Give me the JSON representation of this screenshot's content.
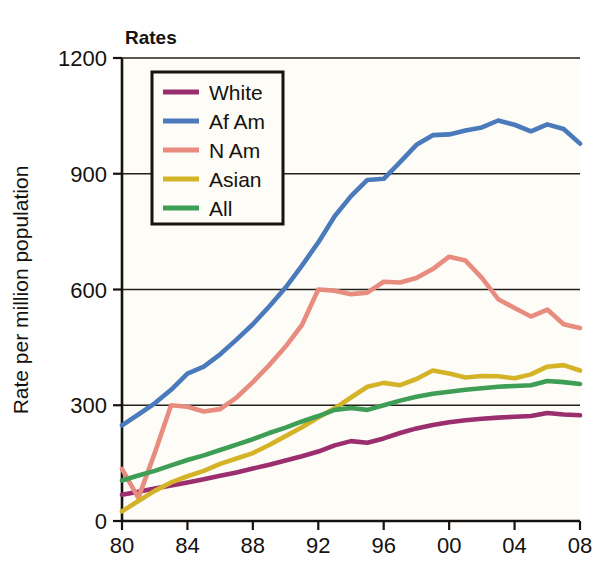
{
  "chart_data": {
    "type": "line",
    "title": "Rates",
    "xlabel": "",
    "ylabel": "Rate per million population",
    "xlim": [
      1980,
      2008
    ],
    "ylim": [
      0,
      1200
    ],
    "yticks": [
      0,
      300,
      600,
      900,
      1200
    ],
    "ytick_labels": [
      "0",
      "300",
      "600",
      "900",
      "1200"
    ],
    "xticks": [
      1980,
      1984,
      1988,
      1992,
      1996,
      2000,
      2004,
      2008
    ],
    "xtick_labels": [
      "80",
      "84",
      "88",
      "92",
      "96",
      "00",
      "04",
      "08"
    ],
    "grid": "horizontal",
    "legend_position": "top-left-inside",
    "x": [
      1980,
      1981,
      1982,
      1983,
      1984,
      1985,
      1986,
      1987,
      1988,
      1989,
      1990,
      1991,
      1992,
      1993,
      1994,
      1995,
      1996,
      1997,
      1998,
      1999,
      2000,
      2001,
      2002,
      2003,
      2004,
      2005,
      2006,
      2007,
      2008
    ],
    "series": [
      {
        "name": "White",
        "color": "#9B2E6E",
        "values": [
          68,
          76,
          84,
          92,
          100,
          108,
          117,
          126,
          136,
          146,
          157,
          168,
          180,
          196,
          207,
          203,
          214,
          228,
          240,
          249,
          256,
          261,
          265,
          268,
          270,
          272,
          280,
          276,
          274
        ]
      },
      {
        "name": "Af Am",
        "color": "#4A79BC",
        "values": [
          248,
          276,
          305,
          340,
          382,
          400,
          432,
          470,
          510,
          556,
          605,
          662,
          722,
          790,
          842,
          884,
          887,
          930,
          975,
          1000,
          1002,
          1012,
          1020,
          1038,
          1027,
          1010,
          1028,
          1016,
          978
        ]
      },
      {
        "name": "N Am",
        "color": "#E88C80",
        "values": [
          135,
          60,
          176,
          300,
          296,
          284,
          290,
          320,
          360,
          404,
          452,
          508,
          600,
          597,
          588,
          592,
          620,
          618,
          630,
          653,
          685,
          675,
          630,
          575,
          552,
          530,
          548,
          510,
          500
        ]
      },
      {
        "name": "Asian",
        "color": "#D5B329",
        "values": [
          25,
          52,
          78,
          100,
          116,
          130,
          148,
          162,
          176,
          197,
          220,
          243,
          268,
          292,
          320,
          348,
          358,
          352,
          368,
          390,
          382,
          372,
          376,
          375,
          370,
          380,
          400,
          404,
          390
        ]
      },
      {
        "name": "All",
        "color": "#3E9E56",
        "values": [
          105,
          118,
          130,
          144,
          158,
          170,
          184,
          198,
          212,
          228,
          242,
          258,
          272,
          288,
          293,
          288,
          300,
          312,
          322,
          330,
          335,
          340,
          344,
          348,
          350,
          352,
          363,
          360,
          355
        ]
      }
    ]
  },
  "legend": {
    "entries": [
      {
        "label": "White"
      },
      {
        "label": "Af Am"
      },
      {
        "label": "N Am"
      },
      {
        "label": "Asian"
      },
      {
        "label": "All"
      }
    ]
  }
}
